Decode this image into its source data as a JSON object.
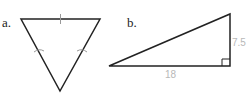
{
  "figures": [
    {
      "label": "a.",
      "shape": "equilateral triangle (inverted)",
      "vertices": [
        [
          21,
          19
        ],
        [
          100,
          19
        ],
        [
          60,
          91
        ]
      ],
      "tick_marks": 3
    },
    {
      "label": "b.",
      "shape": "right triangle",
      "vertices": [
        [
          109,
          66
        ],
        [
          230,
          14
        ],
        [
          230,
          66
        ]
      ],
      "measurements": {
        "base": "18",
        "height": "7.5"
      },
      "right_angle_marker": true
    }
  ],
  "colors": {
    "stroke": "#222222",
    "measure_text": "#b8b8b8",
    "tick": "#999999"
  }
}
